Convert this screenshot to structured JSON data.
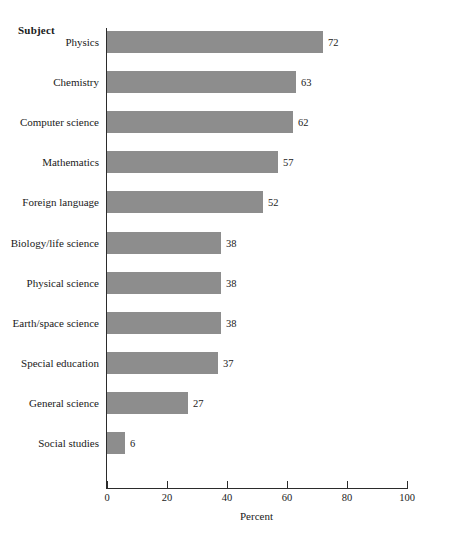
{
  "chart_data": {
    "type": "bar",
    "orientation": "horizontal",
    "title": "",
    "xlabel": "Percent",
    "ylabel": "Subject",
    "xlim": [
      0,
      100
    ],
    "xticks": [
      0,
      20,
      40,
      60,
      80,
      100
    ],
    "grid": false,
    "legend": null,
    "bar_color": "#8d8d8d",
    "axis_color": "#2b2b2b",
    "categories": [
      "Physics",
      "Chemistry",
      "Computer science",
      "Mathematics",
      "Foreign language",
      "Biology/life science",
      "Physical science",
      "Earth/space science",
      "Special education",
      "General science",
      "Social studies"
    ],
    "values": [
      72,
      63,
      62,
      57,
      52,
      38,
      38,
      38,
      37,
      27,
      6
    ],
    "data_labels": [
      "72",
      "63",
      "62",
      "57",
      "52",
      "38",
      "38",
      "38",
      "37",
      "27",
      "6"
    ]
  }
}
